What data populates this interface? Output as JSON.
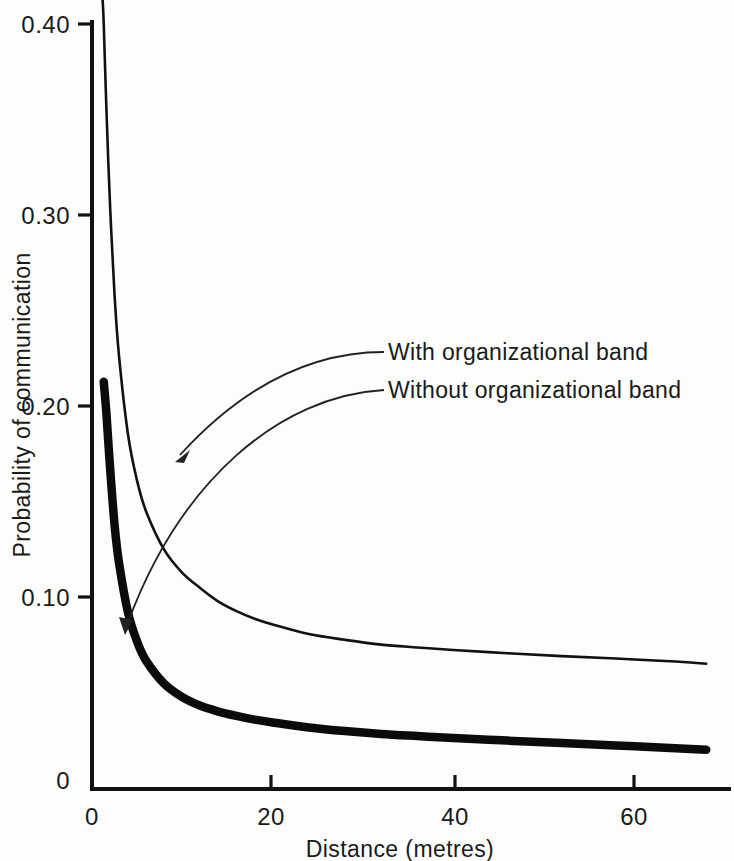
{
  "chart_data": {
    "type": "line",
    "title": "",
    "xlabel": "Distance (metres)",
    "ylabel": "Probability of communication",
    "xlim": [
      0,
      68
    ],
    "ylim": [
      0,
      0.4
    ],
    "grid": false,
    "legend_position": "inline-annotations",
    "x_ticks": [
      "0",
      "20",
      "40",
      "60"
    ],
    "x_tick_values": [
      0,
      20,
      40,
      60
    ],
    "y_ticks": [
      "0",
      "0.10",
      "0.20",
      "0.30",
      "0.40"
    ],
    "y_tick_values": [
      0,
      0.1,
      0.2,
      0.3,
      0.4
    ],
    "series": [
      {
        "name": "With organizational band",
        "style": "thin",
        "x": [
          1.0,
          1.3,
          1.6,
          2.0,
          2.5,
          3.0,
          4.0,
          5.0,
          6.0,
          8.0,
          10.0,
          12.0,
          14.0,
          16.0,
          18.0,
          20.0,
          24.0,
          28.0,
          32.0,
          36.0,
          40.0,
          46.0,
          52.0,
          58.0,
          64.0,
          68.0
        ],
        "y": [
          0.43,
          0.4,
          0.355,
          0.305,
          0.258,
          0.226,
          0.185,
          0.161,
          0.145,
          0.125,
          0.113,
          0.105,
          0.098,
          0.093,
          0.089,
          0.086,
          0.081,
          0.078,
          0.0755,
          0.074,
          0.0727,
          0.071,
          0.0695,
          0.0682,
          0.0668,
          0.0655
        ]
      },
      {
        "name": "Without organizational band",
        "style": "thick",
        "x": [
          1.3,
          1.6,
          2.0,
          2.5,
          3.0,
          4.0,
          5.0,
          6.0,
          8.0,
          10.0,
          12.0,
          14.0,
          16.0,
          18.0,
          20.0,
          24.0,
          28.0,
          32.0,
          36.0,
          40.0,
          46.0,
          52.0,
          58.0,
          64.0,
          68.0
        ],
        "y": [
          0.213,
          0.196,
          0.168,
          0.138,
          0.118,
          0.092,
          0.077,
          0.067,
          0.055,
          0.048,
          0.0435,
          0.0405,
          0.0382,
          0.0363,
          0.0348,
          0.0322,
          0.0303,
          0.0288,
          0.0277,
          0.0267,
          0.0253,
          0.024,
          0.0228,
          0.0215,
          0.0205
        ]
      }
    ],
    "annotations": [
      {
        "text": "With organizational band",
        "label_x": 392,
        "label_y": 358,
        "points_to_series": "With organizational band"
      },
      {
        "text": "Without organizational band",
        "label_x": 392,
        "label_y": 396,
        "points_to_series": "Without organizational band"
      }
    ]
  },
  "axes": {
    "y_title": "Probability of communication",
    "x_title": "Distance (metres)",
    "y_tick_labels": [
      "0.40",
      "0.30",
      "0.20",
      "0.10",
      "0"
    ],
    "x_tick_labels": [
      "0",
      "20",
      "40",
      "60"
    ]
  },
  "colors": {
    "ink": "#111111",
    "background": "#fdfdfc"
  }
}
